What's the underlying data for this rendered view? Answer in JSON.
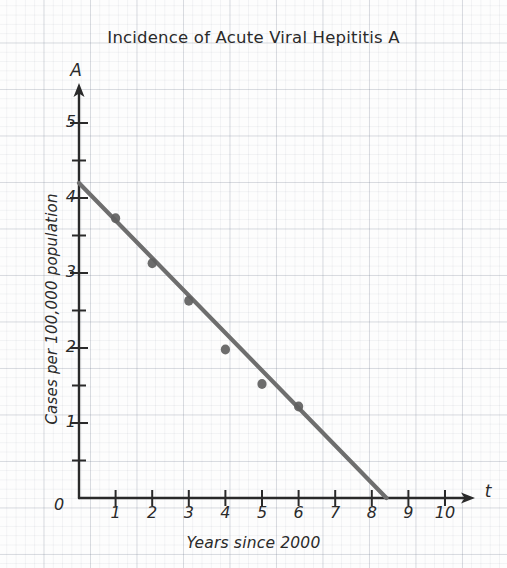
{
  "chart_data": {
    "type": "scatter",
    "title": "Incidence of Acute Viral Hepititis A",
    "xlabel": "Years since 2000",
    "ylabel": "Cases per 100,000 population",
    "x_axis_variable": "t",
    "y_axis_variable": "A",
    "origin_label": "0",
    "xlim": [
      0,
      11
    ],
    "ylim": [
      0,
      5.6
    ],
    "x_ticks": [
      1,
      2,
      3,
      4,
      5,
      6,
      7,
      8,
      9,
      10
    ],
    "x_tick_labels": [
      "1",
      "2",
      "3",
      "4",
      "5",
      "6",
      "7",
      "8",
      "9",
      "10"
    ],
    "y_ticks": [
      1,
      2,
      3,
      4,
      5
    ],
    "y_tick_labels": [
      "1",
      "2",
      "3",
      "4",
      "5"
    ],
    "y_minor_ticks": [
      0.5,
      1.5,
      2.5,
      3.5,
      4.5
    ],
    "grid": true,
    "grid_style": "graph paper",
    "legend": false,
    "points": [
      {
        "x": 1,
        "y": 3.73
      },
      {
        "x": 2,
        "y": 3.13
      },
      {
        "x": 3,
        "y": 2.63
      },
      {
        "x": 4,
        "y": 1.98
      },
      {
        "x": 5,
        "y": 1.52
      },
      {
        "x": 6,
        "y": 1.22
      }
    ],
    "trend_line": {
      "x_start": 0,
      "y_start": 4.2,
      "x_end": 8.4,
      "y_end": 0,
      "slope": -0.5,
      "intercept": 4.2
    },
    "colors": {
      "line": "#6e6e6e",
      "point": "#5f5f5f",
      "axis": "#2a2a2a",
      "grid_major": "#aab0bd",
      "grid_minor": "#dfe3ea",
      "text": "#2a2a2a",
      "background": "#fdfdfd"
    }
  }
}
